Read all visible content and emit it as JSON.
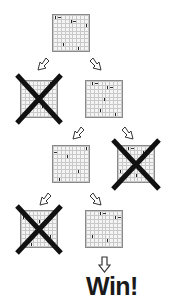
{
  "diagram": {
    "type": "game-tree",
    "colors": {
      "board_grid": "#c8c8c8",
      "board_border": "#8a8a8a",
      "cross": "#111111",
      "text": "#1a1a1a"
    },
    "nodes": [
      {
        "id": "root",
        "level": 0,
        "pruned": false
      },
      {
        "id": "l1-left",
        "level": 1,
        "pruned": true
      },
      {
        "id": "l1-right",
        "level": 1,
        "pruned": false
      },
      {
        "id": "l2-left",
        "level": 2,
        "pruned": false
      },
      {
        "id": "l2-right",
        "level": 2,
        "pruned": true
      },
      {
        "id": "l3-left",
        "level": 3,
        "pruned": true
      },
      {
        "id": "l3-right",
        "level": 3,
        "pruned": false
      }
    ],
    "edges": [
      {
        "from": "root",
        "to": "l1-left",
        "direction": "down-left"
      },
      {
        "from": "root",
        "to": "l1-right",
        "direction": "down-right"
      },
      {
        "from": "l1-right",
        "to": "l2-left",
        "direction": "down-left"
      },
      {
        "from": "l1-right",
        "to": "l2-right",
        "direction": "down-right"
      },
      {
        "from": "l2-left",
        "to": "l3-left",
        "direction": "down-left"
      },
      {
        "from": "l2-left",
        "to": "l3-right",
        "direction": "down-right"
      },
      {
        "from": "l3-right",
        "to": "result",
        "direction": "down"
      }
    ],
    "result_label": "Win!"
  }
}
